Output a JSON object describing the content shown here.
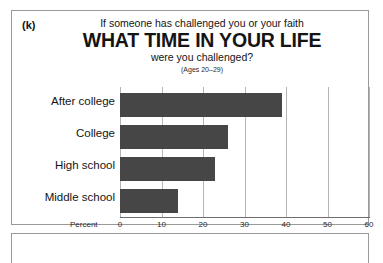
{
  "panel": {
    "letter": "(k)",
    "title_line1": "If someone has challenged you or your faith",
    "title_main": "WHAT TIME IN YOUR LIFE",
    "title_line3": "were you challenged?",
    "subtitle": "(Ages 20–29)"
  },
  "chart_data": {
    "type": "bar",
    "orientation": "horizontal",
    "title": "WHAT TIME IN YOUR LIFE",
    "subtitle": "(Ages 20–29)",
    "title_prefix": "If someone has challenged you or your faith",
    "title_suffix": "were you challenged?",
    "xlabel": "Percent",
    "ylabel": "",
    "categories": [
      "After college",
      "College",
      "High school",
      "Middle school"
    ],
    "values": [
      39,
      26,
      23,
      14
    ],
    "xlim": [
      0,
      60
    ],
    "xticks": [
      0,
      10,
      20,
      30,
      40,
      50,
      60
    ],
    "xtick_labels": [
      "0",
      "10",
      "20",
      "30",
      "40",
      "50",
      "60"
    ],
    "grid": "vertical",
    "legend": "none",
    "bar_color": "#464646",
    "gridline_color": "#b4b4b4",
    "axis_color": "#6e6e6e",
    "background": "#ffffff"
  }
}
